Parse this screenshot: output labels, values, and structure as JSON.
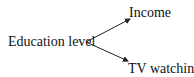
{
  "diagram": {
    "source": {
      "label": "Education level"
    },
    "targets": [
      {
        "label": "Income"
      },
      {
        "label": "TV watching"
      }
    ],
    "edges": [
      {
        "from": "Education level",
        "to": "Income",
        "type": "arrow"
      },
      {
        "from": "Education level",
        "to": "TV watching",
        "type": "arrow"
      }
    ],
    "colors": {
      "line": "#222222",
      "text": "#111111",
      "background": "#ffffff"
    }
  }
}
